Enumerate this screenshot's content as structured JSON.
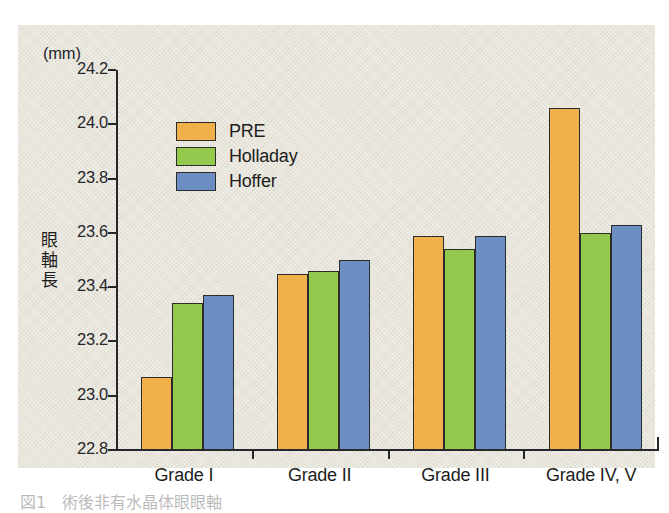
{
  "figure": {
    "unit_label": "(mm)",
    "y_axis_title": "眼軸長",
    "y_axis_title_chars": [
      "眼",
      "軸",
      "長"
    ],
    "caption": "図1　術後非有水晶体眼眼軸"
  },
  "legend": {
    "position": "inside-top-left",
    "items": [
      {
        "label": "PRE",
        "color": "#f0b14d"
      },
      {
        "label": "Holladay",
        "color": "#93c94d"
      },
      {
        "label": "Hoffer",
        "color": "#6d8ec3"
      }
    ]
  },
  "chart_data": {
    "type": "bar",
    "title": "",
    "subtitle": "",
    "xlabel": "",
    "ylabel": "眼軸長",
    "yunit": "(mm)",
    "ylim": [
      22.8,
      24.2
    ],
    "ytick_step": 0.2,
    "ytick_labels": [
      "24.2",
      "24.0",
      "23.8",
      "23.6",
      "23.4",
      "23.2",
      "23.0",
      "22.8"
    ],
    "ytick_values": [
      24.2,
      24.0,
      23.8,
      23.6,
      23.4,
      23.2,
      23.0,
      22.8
    ],
    "grid": false,
    "categories": [
      "Grade I",
      "Grade II",
      "Grade III",
      "Grade IV, V"
    ],
    "series": [
      {
        "name": "PRE",
        "color": "#f0b14d",
        "values": [
          23.07,
          23.45,
          23.59,
          24.06
        ]
      },
      {
        "name": "Holladay",
        "color": "#93c94d",
        "values": [
          23.34,
          23.46,
          23.54,
          23.6
        ]
      },
      {
        "name": "Hoffer",
        "color": "#6d8ec3",
        "values": [
          23.37,
          23.5,
          23.59,
          23.63
        ]
      }
    ],
    "annotations": []
  }
}
